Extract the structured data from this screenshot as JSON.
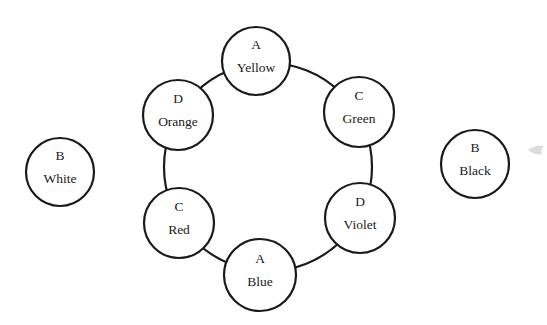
{
  "diagram": {
    "type": "color-wheel-groups",
    "ring": {
      "cx": 268,
      "cy": 167,
      "r": 104
    },
    "nodes": [
      {
        "id": "yellow",
        "group": "A",
        "label": "Yellow",
        "cx": 256,
        "cy": 61,
        "r": 34,
        "on_ring": true
      },
      {
        "id": "green",
        "group": "C",
        "label": "Green",
        "cx": 359,
        "cy": 112,
        "r": 35,
        "on_ring": true
      },
      {
        "id": "violet",
        "group": "D",
        "label": "Violet",
        "cx": 360,
        "cy": 218,
        "r": 35,
        "on_ring": true
      },
      {
        "id": "blue",
        "group": "A",
        "label": "Blue",
        "cx": 260,
        "cy": 275,
        "r": 36,
        "on_ring": true
      },
      {
        "id": "red",
        "group": "C",
        "label": "Red",
        "cx": 179,
        "cy": 223,
        "r": 35,
        "on_ring": true
      },
      {
        "id": "orange",
        "group": "D",
        "label": "Orange",
        "cx": 178,
        "cy": 115,
        "r": 35,
        "on_ring": true
      },
      {
        "id": "white",
        "group": "B",
        "label": "White",
        "cx": 60,
        "cy": 172,
        "r": 34,
        "on_ring": false
      },
      {
        "id": "black",
        "group": "B",
        "label": "Black",
        "cx": 475,
        "cy": 164,
        "r": 34,
        "on_ring": false
      }
    ]
  }
}
